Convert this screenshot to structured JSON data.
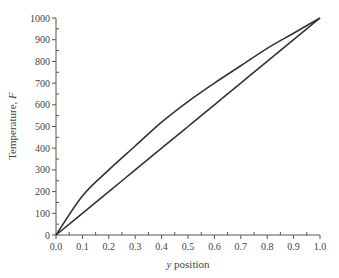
{
  "chart_data": {
    "type": "line",
    "title": "",
    "xlabel": "y position",
    "ylabel": "Temperature, F",
    "xlim": [
      0.0,
      1.0
    ],
    "ylim": [
      0,
      1000
    ],
    "x_ticks": [
      "0.0",
      "0.1",
      "0.2",
      "0.3",
      "0.4",
      "0.5",
      "0.6",
      "0.7",
      "0.8",
      "0.9",
      "1.0"
    ],
    "y_ticks": [
      "0",
      "100",
      "200",
      "300",
      "400",
      "500",
      "600",
      "700",
      "800",
      "900",
      "1000"
    ],
    "grid": false,
    "legend": null,
    "x": [
      0.0,
      0.1,
      0.2,
      0.3,
      0.4,
      0.5,
      0.6,
      0.7,
      0.8,
      0.9,
      1.0
    ],
    "series": [
      {
        "name": "upper curve",
        "values": [
          0,
          180,
          300,
          410,
          520,
          615,
          700,
          780,
          860,
          930,
          1000
        ]
      },
      {
        "name": "linear",
        "values": [
          0,
          100,
          200,
          300,
          400,
          500,
          600,
          700,
          800,
          900,
          1000
        ]
      }
    ]
  }
}
